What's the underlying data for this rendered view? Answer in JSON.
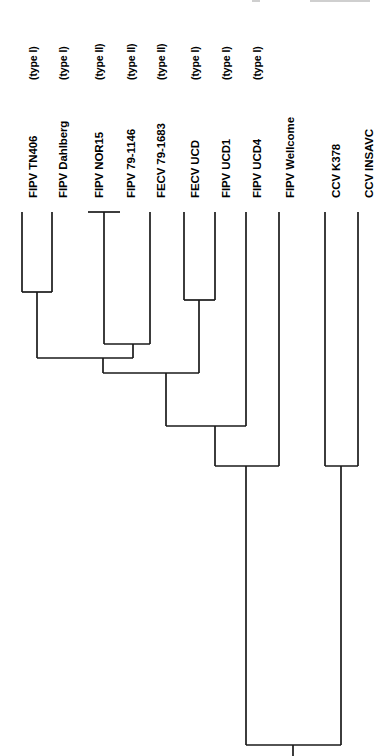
{
  "figure": {
    "kind": "phylogenetic-tree",
    "orientation": "top-down-tips-at-top",
    "background_color": "#ffffff",
    "line_color": "#1a1a1a"
  },
  "chart_data": {
    "type": "tree",
    "title": "",
    "xlabel": "",
    "ylabel": "",
    "grid": false,
    "legend": "none",
    "orientation": "vertical-tips-top",
    "taxa": [
      {
        "name": "FIPV TN406",
        "type": "(type I)",
        "x": 22,
        "tip_y": 212
      },
      {
        "name": "FIPV Dahlberg",
        "type": "(type I)",
        "x": 52,
        "tip_y": 212
      },
      {
        "name": "FIPV NOR15",
        "type": "(type II)",
        "x": 88,
        "tip_y": 212
      },
      {
        "name": "FIPV 79-1146",
        "type": "(type II)",
        "x": 120,
        "tip_y": 212
      },
      {
        "name": "FECV 79-1683",
        "type": "(type II)",
        "x": 150,
        "tip_y": 212
      },
      {
        "name": "FECV UCD",
        "type": "(type I)",
        "x": 184,
        "tip_y": 212
      },
      {
        "name": "FIPV UCD1",
        "type": "(type I)",
        "x": 215,
        "tip_y": 212
      },
      {
        "name": "FIPV UCD4",
        "type": "(type I)",
        "x": 246,
        "tip_y": 212
      },
      {
        "name": "FIPV Wellcome",
        "type": "",
        "x": 279,
        "tip_y": 212
      },
      {
        "name": "CCV K378",
        "type": "",
        "x": 325,
        "tip_y": 212
      },
      {
        "name": "CCV INSAVC",
        "type": "",
        "x": 358,
        "tip_y": 212
      }
    ],
    "nodes": [
      {
        "id": "n_nor_791146",
        "label": "FIPV NOR15 + FIPV 79-1146",
        "left_x": 88,
        "right_x": 120,
        "y": 212,
        "stem_x": 104
      },
      {
        "id": "n_tn_dahl",
        "label": "FIPV TN406 + FIPV Dahlberg",
        "left_x": 22,
        "right_x": 52,
        "y": 292,
        "stem_x": 37
      },
      {
        "id": "n_ucd_ucd1",
        "label": "FECV UCD + FIPV UCD1",
        "left_x": 184,
        "right_x": 215,
        "y": 300,
        "stem_x": 199
      },
      {
        "id": "n_typeII",
        "label": "type II clade",
        "left_x": 104,
        "right_x": 150,
        "y": 344,
        "stem_x": 133
      },
      {
        "id": "n_tn_typeII",
        "label": "TN406 clade + type II clade",
        "left_x": 37,
        "right_x": 133,
        "y": 358,
        "stem_x": 103
      },
      {
        "id": "n_plus_ucd1",
        "label": "+ UCD/UCD1 clade",
        "left_x": 103,
        "right_x": 199,
        "y": 373,
        "stem_x": 166
      },
      {
        "id": "n_plus_ucd4",
        "label": "+ FIPV UCD4",
        "left_x": 166,
        "right_x": 246,
        "y": 426,
        "stem_x": 215
      },
      {
        "id": "n_feline",
        "label": "+ FIPV Wellcome",
        "left_x": 215,
        "right_x": 279,
        "y": 466,
        "stem_x": 246
      },
      {
        "id": "n_ccv",
        "label": "CCV K378 + CCV INSAVC",
        "left_x": 325,
        "right_x": 358,
        "y": 466,
        "stem_x": 341
      },
      {
        "id": "n_root",
        "label": "root",
        "left_x": 246,
        "right_x": 341,
        "y": 745,
        "stem_x": 293
      }
    ],
    "tip_top_y": 212,
    "root_y": 745
  }
}
